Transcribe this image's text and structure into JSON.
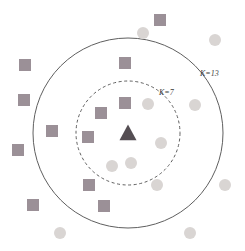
{
  "figure": {
    "width": 245,
    "height": 251,
    "background_color": "#ffffff"
  },
  "labels": {
    "outer": "K=13",
    "inner": "K=7"
  },
  "colors": {
    "square_fill": "#9b9097",
    "circle_fill": "#d9d5d3",
    "triangle_fill": "#554e53",
    "boundary_stroke": "#5f5f5f",
    "label_text": "#3b3b3b",
    "background": "#ffffff"
  },
  "chart_data": {
    "type": "scatter",
    "xlabel": "",
    "ylabel": "",
    "xlim": [
      0,
      245
    ],
    "ylim": [
      0,
      251
    ],
    "grid": false,
    "legend_position": "none",
    "annotations": [
      {
        "name": "outer-radius-label",
        "text": "K=13",
        "x": 200,
        "y": 74,
        "style": "italic"
      },
      {
        "name": "inner-radius-label",
        "text": "K=7",
        "x": 159,
        "y": 93,
        "style": "italic"
      }
    ],
    "boundaries": [
      {
        "name": "outer-boundary",
        "label": "K=13",
        "shape": "circle",
        "cx": 128,
        "cy": 133,
        "r": 95,
        "stroke": "#5f5f5f",
        "stroke_width": 1,
        "dashed": false,
        "neighbors_enclosed": 13
      },
      {
        "name": "inner-boundary",
        "label": "K=7",
        "shape": "circle",
        "cx": 128,
        "cy": 133,
        "r": 52,
        "stroke": "#5f5f5f",
        "stroke_width": 1,
        "dashed": true,
        "neighbors_enclosed": 7
      }
    ],
    "series": [
      {
        "name": "query-point",
        "marker": "triangle",
        "color": "#554e53",
        "size": 17,
        "points": [
          {
            "x": 128,
            "y": 133
          }
        ]
      },
      {
        "name": "class-a-squares",
        "marker": "square",
        "color": "#9b9097",
        "size": 12,
        "points": [
          {
            "x": 160,
            "y": 20
          },
          {
            "x": 25,
            "y": 65
          },
          {
            "x": 24,
            "y": 100
          },
          {
            "x": 125,
            "y": 63
          },
          {
            "x": 52,
            "y": 131
          },
          {
            "x": 18,
            "y": 150
          },
          {
            "x": 125,
            "y": 103
          },
          {
            "x": 101,
            "y": 113
          },
          {
            "x": 88,
            "y": 137
          },
          {
            "x": 89,
            "y": 185
          },
          {
            "x": 33,
            "y": 205
          },
          {
            "x": 104,
            "y": 206
          }
        ]
      },
      {
        "name": "class-b-circles",
        "marker": "circle",
        "color": "#d9d5d3",
        "size": 12,
        "points": [
          {
            "x": 143,
            "y": 33
          },
          {
            "x": 215,
            "y": 40
          },
          {
            "x": 195,
            "y": 105
          },
          {
            "x": 148,
            "y": 104
          },
          {
            "x": 161,
            "y": 143
          },
          {
            "x": 131,
            "y": 163
          },
          {
            "x": 157,
            "y": 185
          },
          {
            "x": 225,
            "y": 185
          },
          {
            "x": 60,
            "y": 233
          },
          {
            "x": 190,
            "y": 233
          },
          {
            "x": 112,
            "y": 166
          }
        ]
      }
    ]
  }
}
